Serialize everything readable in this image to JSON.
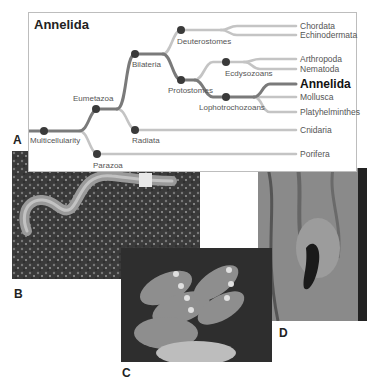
{
  "figure": {
    "tree": {
      "title": "Annelida",
      "panel_label": "A",
      "internal_nodes": [
        {
          "id": "multicellularity",
          "label": "Multicellularity"
        },
        {
          "id": "eumetazoa",
          "label": "Eumetazoa"
        },
        {
          "id": "parazoa",
          "label": "Parazoa"
        },
        {
          "id": "bilateria",
          "label": "Bilateria"
        },
        {
          "id": "radiata",
          "label": "Radiata"
        },
        {
          "id": "deuterostomes",
          "label": "Deuterostomes"
        },
        {
          "id": "protostomes",
          "label": "Protostomes"
        },
        {
          "id": "ecdysozoans",
          "label": "Ecdysozoans"
        },
        {
          "id": "lophotrochozoans",
          "label": "Lophotrochozoans"
        }
      ],
      "tips": [
        {
          "label": "Chordata",
          "highlight": false
        },
        {
          "label": "Echinodermata",
          "highlight": false
        },
        {
          "label": "Arthropoda",
          "highlight": false
        },
        {
          "label": "Nematoda",
          "highlight": false
        },
        {
          "label": "Annelida",
          "highlight": true
        },
        {
          "label": "Mollusca",
          "highlight": false
        },
        {
          "label": "Platyhelminthes",
          "highlight": false
        },
        {
          "label": "Cnidaria",
          "highlight": false
        },
        {
          "label": "Porifera",
          "highlight": false
        }
      ],
      "colors": {
        "highlight_branch": "#7a7a7a",
        "other_branch": "#c4c4c4",
        "node": "#3a3a3a"
      }
    },
    "photos": [
      {
        "panel_label": "B",
        "subject": "earthworm on soil"
      },
      {
        "panel_label": "C",
        "subject": "feather duster tube worms"
      },
      {
        "panel_label": "D",
        "subject": "leech on hand"
      }
    ]
  }
}
